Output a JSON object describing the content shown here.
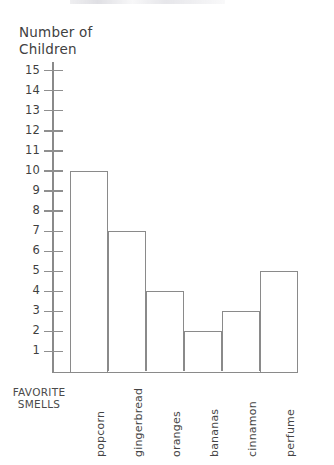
{
  "chart_data": {
    "type": "bar",
    "title": "",
    "xlabel": "FAVORITE\nSMELLS",
    "ylabel": "Number of\nChildren",
    "categories": [
      "popcorn",
      "gingerbread",
      "oranges",
      "bananas",
      "cinnamon",
      "perfume"
    ],
    "values": [
      10,
      7,
      4,
      2,
      3,
      5
    ],
    "ylim": [
      0,
      15
    ],
    "ytick_labels": [
      "15",
      "14",
      "13",
      "12",
      "11",
      "10",
      "9",
      "8",
      "7",
      "6",
      "5",
      "4",
      "3",
      "2",
      "1"
    ],
    "ytick_values": [
      15,
      14,
      13,
      12,
      11,
      10,
      9,
      8,
      7,
      6,
      5,
      4,
      3,
      2,
      1
    ],
    "grid": false,
    "legend": null,
    "bar_style": {
      "fill": "#ffffff",
      "stroke": "#8a8a8a",
      "contiguous": true
    },
    "axis_color": "#8a8a8a",
    "text_color": "#414141"
  }
}
